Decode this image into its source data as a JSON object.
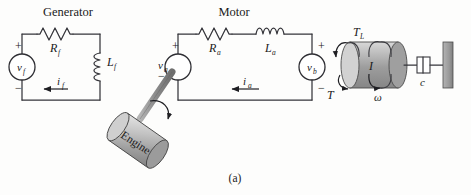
{
  "figure": {
    "caption": "(a)",
    "background_color": "#fdfdfc",
    "ink_color": "#35353a"
  },
  "generator": {
    "title": "Generator",
    "source": {
      "name": "voltage-source",
      "label": "v",
      "subscript": "f",
      "plus": "+",
      "minus": "−"
    },
    "resistor": {
      "label": "R",
      "subscript": "f"
    },
    "inductor": {
      "label": "L",
      "subscript": "f"
    },
    "current": {
      "label": "i",
      "subscript": "f",
      "direction": "left"
    }
  },
  "motor": {
    "title": "Motor",
    "armature_source": {
      "name": "armature-voltage-source",
      "label": "v",
      "subscript": "a",
      "plus": "+",
      "minus": "−"
    },
    "resistor": {
      "label": "R",
      "subscript": "a"
    },
    "inductor": {
      "label": "L",
      "subscript": "a"
    },
    "back_emf": {
      "name": "back-emf-source",
      "label": "v",
      "subscript": "b",
      "plus": "+",
      "minus": "−"
    },
    "current": {
      "label": "i",
      "subscript": "a",
      "direction": "left"
    }
  },
  "engine": {
    "label": "Engine",
    "body_color": "#b7b7b7",
    "shaft_color": "#9a9a9a"
  },
  "load": {
    "inertia": {
      "label": "I",
      "body_color": "#a9a9a9"
    },
    "torque_load": {
      "label": "T",
      "subscript": "L"
    },
    "torque_motor": {
      "label": "T",
      "subscript": ""
    },
    "speed": {
      "label": "ω",
      "subscript": ""
    },
    "damper": {
      "label": "c"
    }
  }
}
